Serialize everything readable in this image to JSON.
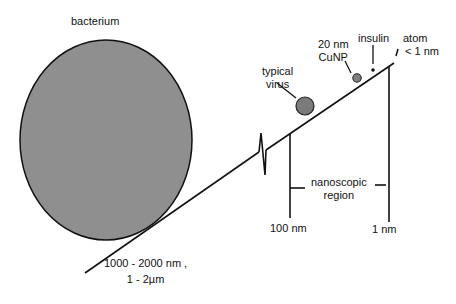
{
  "colors": {
    "line": "#111111",
    "bacterium_fill": "#8f8f8f",
    "virus_fill": "#7a7a7a",
    "cunp_fill": "#808080",
    "insulin_fill": "#111111"
  },
  "labels": {
    "bacterium": "bacterium",
    "virus_line1": "typical",
    "virus_line2": "virus",
    "cunp_line1": "20 nm",
    "cunp_line2": "CuNP",
    "insulin": "insulin",
    "atom_line1": "atom",
    "atom_line2": "< 1 nm",
    "nanoscopic_line1": "nanoscopic",
    "nanoscopic_line2": "region",
    "mark_100nm": "100 nm",
    "mark_1nm": "1 nm",
    "bacterium_size_line1": "1000 - 2000 nm ,",
    "bacterium_size_line2": "1 - 2µm"
  }
}
